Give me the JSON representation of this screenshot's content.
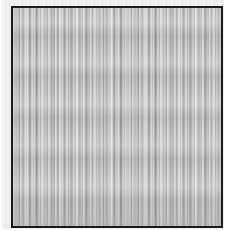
{
  "image": {
    "description": "Grayscale vertical-stroke texture (grass/wood-grain-like) inside a black square frame",
    "colors": {
      "frame_border": "#1a1a1a",
      "texture_light": "#e0e0e0",
      "texture_mid": "#b8b8b8",
      "texture_dark": "#9a9a9a",
      "background": "#ffffff"
    }
  }
}
